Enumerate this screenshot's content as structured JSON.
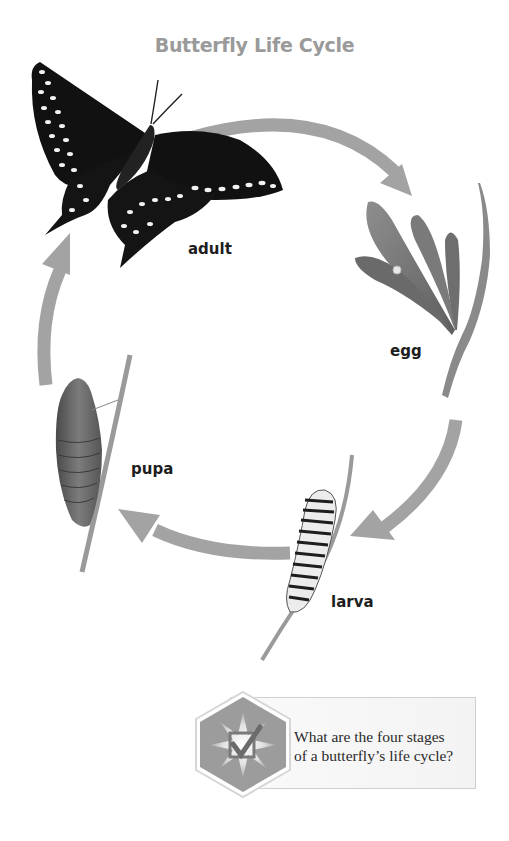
{
  "diagram": {
    "title": "Butterfly Life Cycle",
    "stages": [
      {
        "id": "adult",
        "label": "adult"
      },
      {
        "id": "egg",
        "label": "egg"
      },
      {
        "id": "larva",
        "label": "larva"
      },
      {
        "id": "pupa",
        "label": "pupa"
      }
    ],
    "arrow_color": "#a3a3a3",
    "cycle_order": [
      "adult",
      "egg",
      "larva",
      "pupa"
    ]
  },
  "question_box": {
    "icon": "checkbox-check-icon",
    "lines": [
      "What are the four stages",
      "of a butterfly’s life cycle?"
    ]
  }
}
